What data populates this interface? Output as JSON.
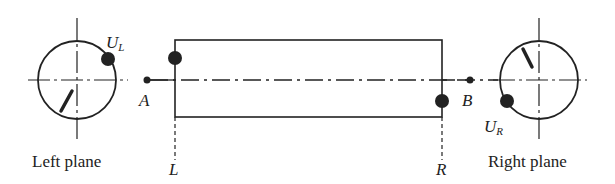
{
  "diagram": {
    "labels": {
      "left_plane": "Left plane",
      "right_plane": "Right plane",
      "bearing_a": "A",
      "bearing_b": "B",
      "plane_l": "L",
      "plane_r": "R",
      "unbalance_left": "U",
      "unbalance_left_sub": "L",
      "unbalance_right": "U",
      "unbalance_right_sub": "R"
    },
    "colors": {
      "line": "#222222",
      "background": "#ffffff"
    }
  }
}
